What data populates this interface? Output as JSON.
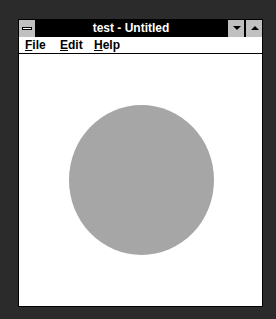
{
  "window": {
    "title": "test - Untitled",
    "system_menu_icon": "system-menu-icon",
    "controls": {
      "minimize_icon": "minimize-arrow-icon",
      "maximize_icon": "maximize-arrow-icon"
    }
  },
  "menubar": {
    "items": [
      {
        "label_underlined": "F",
        "label_rest": "ile"
      },
      {
        "label_underlined": "E",
        "label_rest": "dit"
      },
      {
        "label_underlined": "H",
        "label_rest": "elp"
      }
    ]
  },
  "canvas": {
    "shape": "circle",
    "fill_color": "#a6a6a6"
  }
}
